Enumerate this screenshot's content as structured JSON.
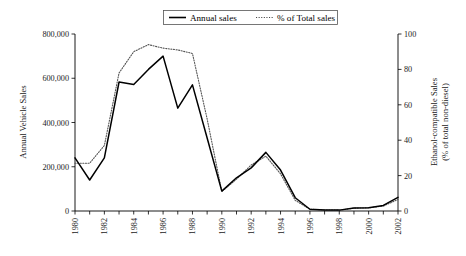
{
  "chart_data": {
    "type": "line",
    "title": "",
    "xlabel": "",
    "ylabel": "Annual Vehicle Sales",
    "y2label_line1": "Ethanol-compatible Sales",
    "y2label_line2": "(% of total non-diesel)",
    "grid": false,
    "legend_position": "top-center",
    "x": [
      1980,
      1981,
      1982,
      1983,
      1984,
      1985,
      1986,
      1987,
      1988,
      1989,
      1990,
      1991,
      1992,
      1993,
      1994,
      1995,
      1996,
      1997,
      1998,
      1999,
      2000,
      2001,
      2002
    ],
    "xtick_labels": [
      "1980",
      "",
      "1982",
      "",
      "1984",
      "",
      "1986",
      "",
      "1988",
      "",
      "1990",
      "",
      "1992",
      "",
      "1994",
      "",
      "1996",
      "",
      "1998",
      "",
      "2000",
      "",
      "2002"
    ],
    "xlim": [
      1980,
      2002
    ],
    "ylim": [
      0,
      800000
    ],
    "ytick_values": [
      0,
      200000,
      400000,
      600000,
      800000
    ],
    "ytick_labels": [
      "0",
      "200,000",
      "400,000",
      "600,000",
      "800,000"
    ],
    "y2lim": [
      0,
      100
    ],
    "y2tick_values": [
      0,
      20,
      40,
      60,
      80,
      100
    ],
    "y2tick_labels": [
      "0",
      "20",
      "40",
      "60",
      "80",
      "100"
    ],
    "series": [
      {
        "name": "Annual sales",
        "axis": "left",
        "style": "solid",
        "color": "#000000",
        "values": [
          240000,
          140000,
          240000,
          583000,
          572000,
          640000,
          700000,
          465000,
          570000,
          330000,
          90000,
          150000,
          195000,
          265000,
          185000,
          60000,
          8000,
          5000,
          4000,
          14000,
          15000,
          25000,
          62000
        ]
      },
      {
        "name": "% of Total sales",
        "axis": "right",
        "style": "dotted",
        "color": "#555555",
        "values": [
          27,
          27,
          37,
          78,
          90,
          94,
          92,
          91,
          89,
          52,
          11,
          18,
          26,
          31,
          21,
          6,
          1,
          0.6,
          0.5,
          1.6,
          1.8,
          2.8,
          6.5
        ]
      }
    ]
  },
  "legend": {
    "items": [
      {
        "label": "Annual sales",
        "style": "solid"
      },
      {
        "label": "% of Total sales",
        "style": "dotted"
      }
    ]
  }
}
